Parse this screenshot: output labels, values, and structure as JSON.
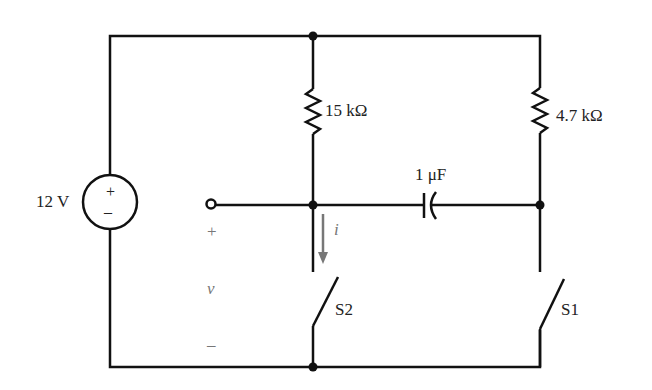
{
  "diagram": {
    "type": "circuit schematic",
    "source": {
      "label": "12 V",
      "plus": "+",
      "minus": "–"
    },
    "resistors": [
      {
        "id": "R1",
        "label": "15 kΩ"
      },
      {
        "id": "R2",
        "label": "4.7 kΩ"
      }
    ],
    "capacitor": {
      "label": "1 μF"
    },
    "switches": [
      {
        "id": "S2",
        "label": "S2"
      },
      {
        "id": "S1",
        "label": "S1"
      }
    ],
    "current": {
      "label": "i"
    },
    "voltage": {
      "label": "v",
      "plus": "+",
      "minus": "–"
    },
    "colors": {
      "wire": "#111111",
      "annotation": "#777777"
    }
  }
}
